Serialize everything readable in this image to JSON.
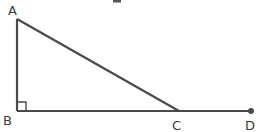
{
  "diagram": {
    "type": "geometry",
    "colors": {
      "line": "#4a4a4a",
      "label": "#3a3a3a",
      "background": "#ffffff"
    },
    "points": {
      "A": {
        "label": "A",
        "x": 17,
        "y": 19
      },
      "B": {
        "label": "B",
        "x": 17,
        "y": 111
      },
      "C": {
        "label": "C",
        "x": 179,
        "y": 111
      },
      "D": {
        "label": "D",
        "x": 251,
        "y": 111
      }
    },
    "segments": [
      {
        "from": "A",
        "to": "B"
      },
      {
        "from": "A",
        "to": "C"
      },
      {
        "from": "B",
        "to": "C"
      },
      {
        "from": "C",
        "to": "D"
      }
    ],
    "right_angle_marker": {
      "at": "B",
      "size": 9
    },
    "endpoint_dot": {
      "at": "D",
      "radius": 3
    }
  }
}
